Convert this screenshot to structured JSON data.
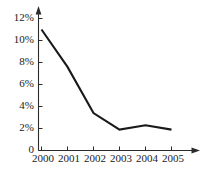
{
  "chart_data": {
    "type": "line",
    "title": "",
    "subtitle": "",
    "xlabel": "",
    "ylabel": "",
    "categories": [
      "2000",
      "2001",
      "2002",
      "2003",
      "2004",
      "2005"
    ],
    "x": [
      2000,
      2001,
      2002,
      2003,
      2004,
      2005
    ],
    "values": [
      11.0,
      7.6,
      3.4,
      1.9,
      2.3,
      1.9
    ],
    "series": [
      {
        "name": "",
        "values": [
          11.0,
          7.6,
          3.4,
          1.9,
          2.3,
          1.9
        ]
      }
    ],
    "ylim": [
      0,
      13
    ],
    "xlim": [
      2000,
      2005
    ],
    "ytick_labels": [
      "0",
      "2%",
      "4%",
      "6%",
      "8%",
      "10%",
      "12%"
    ],
    "ytick_values": [
      0,
      2,
      4,
      6,
      8,
      10,
      12
    ],
    "xtick_labels": [
      "2000",
      "2001",
      "2002",
      "2003",
      "2004",
      "2005"
    ],
    "grid": false,
    "legend": null,
    "legend_position": "none",
    "annotations": [],
    "axis_arrows": true,
    "line_color": "#1a1a1a",
    "axis_color": "#2b2b2b",
    "background_color": "#ffffff"
  }
}
